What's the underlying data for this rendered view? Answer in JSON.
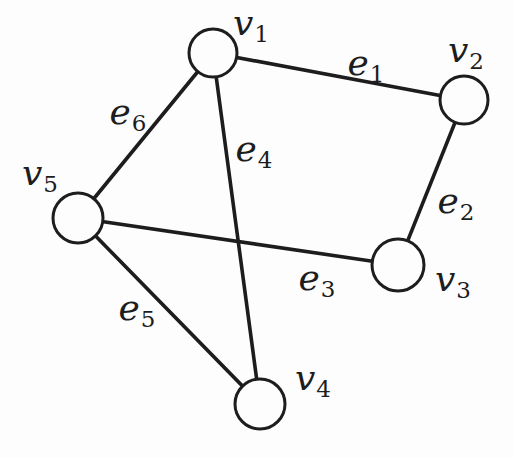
{
  "figure": {
    "vertex_count": 5,
    "edge_count": 6
  },
  "colors": {
    "ink": "#1d1d1d",
    "paper": "#fdfdfd",
    "vertex_fill": "#fdfdfd"
  },
  "style": {
    "edge_stroke_width": 3.6,
    "vertex_stroke_width": 3
  },
  "graph": {
    "vertices": [
      {
        "id": "v1",
        "label": "v",
        "sub": "1",
        "x": 213,
        "y": 53,
        "r": 24,
        "label_x": 251,
        "label_y": 35
      },
      {
        "id": "v2",
        "label": "v",
        "sub": "2",
        "x": 464,
        "y": 100,
        "r": 24,
        "label_x": 466,
        "label_y": 62
      },
      {
        "id": "v3",
        "label": "v",
        "sub": "3",
        "x": 398,
        "y": 265,
        "r": 26,
        "label_x": 453,
        "label_y": 291
      },
      {
        "id": "v4",
        "label": "v",
        "sub": "4",
        "x": 260,
        "y": 404,
        "r": 25,
        "label_x": 313,
        "label_y": 390
      },
      {
        "id": "v5",
        "label": "v",
        "sub": "5",
        "x": 78,
        "y": 218,
        "r": 25,
        "label_x": 40,
        "label_y": 185
      }
    ],
    "edges": [
      {
        "id": "e1",
        "label": "e",
        "sub": "1",
        "from": "v1",
        "to": "v2",
        "label_x": 366,
        "label_y": 75
      },
      {
        "id": "e2",
        "label": "e",
        "sub": "2",
        "from": "v2",
        "to": "v3",
        "label_x": 456,
        "label_y": 213
      },
      {
        "id": "e3",
        "label": "e",
        "sub": "3",
        "from": "v5",
        "to": "v3",
        "label_x": 317,
        "label_y": 290
      },
      {
        "id": "e4",
        "label": "e",
        "sub": "4",
        "from": "v1",
        "to": "v4",
        "label_x": 254,
        "label_y": 161
      },
      {
        "id": "e5",
        "label": "e",
        "sub": "5",
        "from": "v5",
        "to": "v4",
        "label_x": 137,
        "label_y": 320
      },
      {
        "id": "e6",
        "label": "e",
        "sub": "6",
        "from": "v1",
        "to": "v5",
        "label_x": 128,
        "label_y": 124
      }
    ]
  }
}
